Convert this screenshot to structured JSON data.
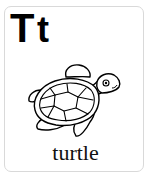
{
  "card": {
    "letter_upper": "T",
    "letter_lower": "t",
    "word": "turtle",
    "illustration": "turtle-icon",
    "colors": {
      "background": "#ffffff",
      "border": "#d9d9d9",
      "ink": "#000000"
    }
  }
}
